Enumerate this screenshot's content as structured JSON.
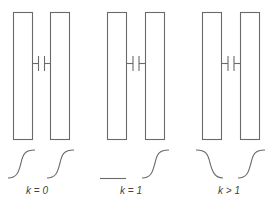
{
  "diagram": {
    "colors": {
      "stroke": "#6a6a6a",
      "text": "#444444",
      "background": "#ffffff"
    },
    "panels": [
      {
        "id": "panel-1",
        "label": "k = 0",
        "left_curve": "rising-s-curve",
        "right_curve": "rising-s-curve"
      },
      {
        "id": "panel-2",
        "label": "k = 1",
        "left_curve": "flat-line",
        "right_curve": "rising-s-curve"
      },
      {
        "id": "panel-3",
        "label": "k > 1",
        "left_curve": "falling-s-curve",
        "right_curve": "rising-s-curve"
      }
    ],
    "icons": {
      "coupling": "capacitor-icon"
    }
  }
}
